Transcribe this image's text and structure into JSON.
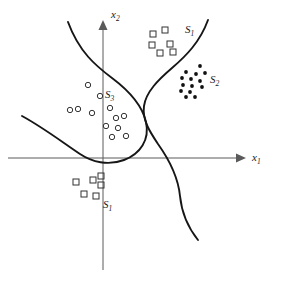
{
  "figure": {
    "width": 282,
    "height": 287,
    "background": "#ffffff",
    "curve_color": "#161616",
    "axis_color": "#5a5a5a",
    "marker_color": "#333333",
    "dot_color": "#111111"
  },
  "axes": {
    "x_label": "x",
    "x_sub": "1",
    "y_label": "x",
    "y_sub": "2",
    "origin": {
      "x": 103,
      "y": 158
    },
    "x_axis": {
      "x1": 8,
      "y1": 158,
      "x2": 242,
      "y2": 158
    },
    "y_axis": {
      "x1": 103,
      "y1": 270,
      "x2": 103,
      "y2": 24
    }
  },
  "labels": [
    {
      "name": "region-label-s1-upper",
      "text": "S",
      "sub": "1",
      "x": 185,
      "y": 24
    },
    {
      "name": "region-label-s2",
      "text": "S",
      "sub": "2",
      "x": 210,
      "y": 74
    },
    {
      "name": "region-label-s3",
      "text": "S",
      "sub": "3",
      "x": 105,
      "y": 89
    },
    {
      "name": "region-label-s1-lower",
      "text": "S",
      "sub": "1",
      "x": 103,
      "y": 199
    }
  ],
  "chart_data": {
    "type": "scatter",
    "title": "",
    "xlabel": "x1",
    "ylabel": "x2",
    "grid": false,
    "legend": "none",
    "note": "Pattern-classification diagram: three class regions S1, S2, S3 separated by two decision-boundary curves. Class S1 occupies two disjoint regions.",
    "series": [
      {
        "name": "S1",
        "marker": "open-square",
        "region": "upper",
        "points": [
          {
            "x": 153,
            "y": 34
          },
          {
            "x": 165,
            "y": 30
          },
          {
            "x": 152,
            "y": 45
          },
          {
            "x": 170,
            "y": 44
          },
          {
            "x": 160,
            "y": 53
          },
          {
            "x": 173,
            "y": 52
          }
        ]
      },
      {
        "name": "S1",
        "marker": "open-square",
        "region": "lower",
        "points": [
          {
            "x": 76,
            "y": 182
          },
          {
            "x": 93,
            "y": 180
          },
          {
            "x": 101,
            "y": 176
          },
          {
            "x": 101,
            "y": 185
          },
          {
            "x": 84,
            "y": 194
          },
          {
            "x": 96,
            "y": 196
          }
        ]
      },
      {
        "name": "S2",
        "marker": "filled-dot",
        "region": "right",
        "points": [
          {
            "x": 200,
            "y": 66
          },
          {
            "x": 186,
            "y": 72
          },
          {
            "x": 196,
            "y": 74
          },
          {
            "x": 205,
            "y": 73
          },
          {
            "x": 182,
            "y": 78
          },
          {
            "x": 191,
            "y": 79
          },
          {
            "x": 200,
            "y": 81
          },
          {
            "x": 183,
            "y": 85
          },
          {
            "x": 192,
            "y": 86
          },
          {
            "x": 202,
            "y": 87
          },
          {
            "x": 181,
            "y": 91
          },
          {
            "x": 190,
            "y": 92
          },
          {
            "x": 186,
            "y": 97
          },
          {
            "x": 195,
            "y": 97
          }
        ]
      },
      {
        "name": "S3",
        "marker": "open-circle",
        "region": "left",
        "points": [
          {
            "x": 88,
            "y": 85
          },
          {
            "x": 100,
            "y": 96
          },
          {
            "x": 70,
            "y": 110
          },
          {
            "x": 78,
            "y": 109
          },
          {
            "x": 92,
            "y": 113
          },
          {
            "x": 110,
            "y": 108
          },
          {
            "x": 116,
            "y": 118
          },
          {
            "x": 124,
            "y": 116
          },
          {
            "x": 106,
            "y": 126
          },
          {
            "x": 118,
            "y": 128
          },
          {
            "x": 112,
            "y": 137
          },
          {
            "x": 126,
            "y": 136
          }
        ]
      }
    ],
    "boundaries": [
      {
        "name": "blob-curve",
        "description": "Curve entering top-left, sweeping right and down around the S3 cluster, looping below the origin and back out to the lower left.",
        "path": "M 68 22 C 79 52 96 66 112 78 C 128 90 142 104 146 122 C 150 140 140 154 124 160 C 108 166 92 162 80 154 C 62 142 44 128 22 116"
      },
      {
        "name": "s-curve",
        "description": "S-shaped boundary from upper right, bending left toward the origin, then sweeping right and down to the bottom.",
        "path": "M 208 20 C 200 42 186 56 172 68 C 158 80 146 92 144 106 C 142 120 150 132 158 144 C 168 158 178 176 180 196 C 182 216 190 230 198 240"
      }
    ]
  }
}
